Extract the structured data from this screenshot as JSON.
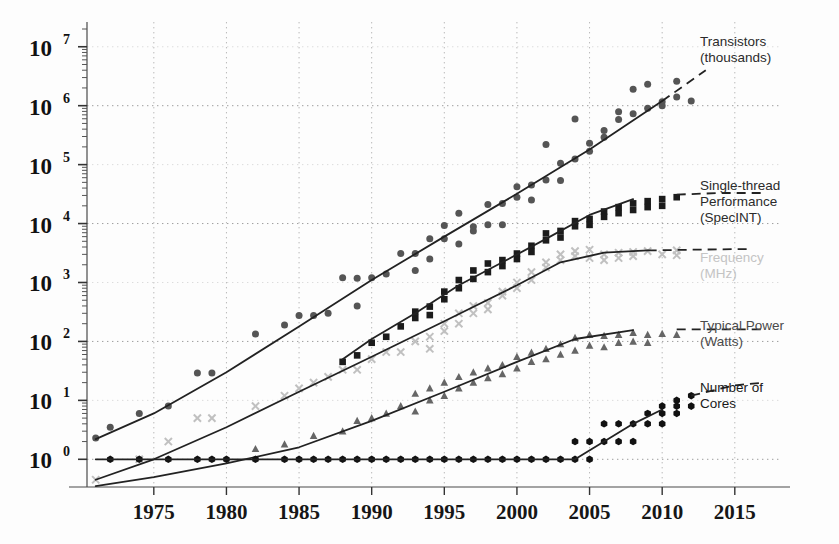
{
  "chart_data": {
    "type": "scatter",
    "title": "",
    "xlabel": "",
    "ylabel": "",
    "xlim": [
      1970,
      2018
    ],
    "ylim_log10": [
      -0.45,
      7.4
    ],
    "yscale": "log",
    "grid": true,
    "legend_position": "right",
    "xticks": [
      1975,
      1980,
      1985,
      1990,
      1995,
      2000,
      2005,
      2010,
      2015
    ],
    "yticks": [
      "10^0",
      "10^1",
      "10^2",
      "10^3",
      "10^4",
      "10^5",
      "10^6",
      "10^7"
    ],
    "ytick_mantissa": "10",
    "ytick_exponents": [
      "7",
      "6",
      "5",
      "4",
      "3",
      "2",
      "1",
      "0"
    ],
    "series": [
      {
        "name": "Transistors (thousands)",
        "legend_line1": "Transistors",
        "legend_line2": "(thousands)",
        "marker": "circle",
        "color": "#555555",
        "legend_y": 46,
        "trend": [
          [
            1971,
            2.2
          ],
          [
            1975,
            6.0
          ],
          [
            1980,
            30
          ],
          [
            1985,
            180
          ],
          [
            1990,
            1100
          ],
          [
            1995,
            6000
          ],
          [
            2000,
            32000
          ],
          [
            2005,
            180000
          ],
          [
            2010,
            1200000
          ],
          [
            2013,
            4000000
          ]
        ],
        "trend_dash_from": 2010,
        "points": [
          [
            1971,
            2.3
          ],
          [
            1972,
            3.5
          ],
          [
            1974,
            6.0
          ],
          [
            1976,
            8.0
          ],
          [
            1978,
            29
          ],
          [
            1979,
            29
          ],
          [
            1982,
            134
          ],
          [
            1984,
            190
          ],
          [
            1985,
            275
          ],
          [
            1986,
            275
          ],
          [
            1987,
            300
          ],
          [
            1988,
            1200
          ],
          [
            1989,
            1180
          ],
          [
            1989,
            400
          ],
          [
            1990,
            1200
          ],
          [
            1991,
            1400
          ],
          [
            1992,
            3100
          ],
          [
            1993,
            3100
          ],
          [
            1993,
            1600
          ],
          [
            1994,
            2500
          ],
          [
            1994,
            5500
          ],
          [
            1995,
            5500
          ],
          [
            1995,
            9300
          ],
          [
            1996,
            4500
          ],
          [
            1996,
            15000
          ],
          [
            1997,
            7500
          ],
          [
            1997,
            8800
          ],
          [
            1998,
            9500
          ],
          [
            1998,
            21000
          ],
          [
            1999,
            22000
          ],
          [
            1999,
            9500
          ],
          [
            2000,
            42000
          ],
          [
            2000,
            28000
          ],
          [
            2001,
            45000
          ],
          [
            2001,
            25000
          ],
          [
            2002,
            55000
          ],
          [
            2002,
            220000
          ],
          [
            2003,
            105000
          ],
          [
            2003,
            54000
          ],
          [
            2004,
            125000
          ],
          [
            2004,
            592000
          ],
          [
            2005,
            230000
          ],
          [
            2005,
            169000
          ],
          [
            2006,
            291000
          ],
          [
            2006,
            380000
          ],
          [
            2007,
            582000
          ],
          [
            2007,
            789000
          ],
          [
            2008,
            731000
          ],
          [
            2008,
            1900000
          ],
          [
            2009,
            904000
          ],
          [
            2009,
            2300000
          ],
          [
            2010,
            1170000
          ],
          [
            2010,
            1000000
          ],
          [
            2011,
            1400000
          ],
          [
            2011,
            2600000
          ],
          [
            2012,
            1200000
          ]
        ]
      },
      {
        "name": "Single-thread Performance (SpecINT)",
        "legend_line1": "Single-thread",
        "legend_line2": "Performance",
        "legend_line3": "(SpecINT)",
        "marker": "square",
        "color": "#1b1b1b",
        "legend_y": 190,
        "trend": [
          [
            1988,
            50
          ],
          [
            1990,
            110
          ],
          [
            1993,
            300
          ],
          [
            1996,
            900
          ],
          [
            1999,
            2200
          ],
          [
            2002,
            5500
          ],
          [
            2005,
            14000
          ],
          [
            2008,
            26000
          ],
          [
            2011,
            31000
          ],
          [
            2014,
            33000
          ],
          [
            2017,
            33000
          ]
        ],
        "trend_dash_from": 2010,
        "points": [
          [
            1988,
            45
          ],
          [
            1989,
            58
          ],
          [
            1990,
            95
          ],
          [
            1991,
            120
          ],
          [
            1992,
            180
          ],
          [
            1993,
            250
          ],
          [
            1993,
            320
          ],
          [
            1994,
            390
          ],
          [
            1994,
            280
          ],
          [
            1995,
            520
          ],
          [
            1995,
            700
          ],
          [
            1996,
            800
          ],
          [
            1996,
            1100
          ],
          [
            1997,
            1150
          ],
          [
            1997,
            1600
          ],
          [
            1998,
            1500
          ],
          [
            1998,
            2100
          ],
          [
            1999,
            2400
          ],
          [
            1999,
            1900
          ],
          [
            2000,
            3100
          ],
          [
            2000,
            2500
          ],
          [
            2001,
            4200
          ],
          [
            2001,
            3300
          ],
          [
            2002,
            5200
          ],
          [
            2002,
            6800
          ],
          [
            2003,
            7500
          ],
          [
            2003,
            5800
          ],
          [
            2004,
            9000
          ],
          [
            2004,
            11000
          ],
          [
            2005,
            12000
          ],
          [
            2005,
            9500
          ],
          [
            2006,
            16000
          ],
          [
            2006,
            13000
          ],
          [
            2007,
            19000
          ],
          [
            2007,
            15000
          ],
          [
            2008,
            22000
          ],
          [
            2008,
            17000
          ],
          [
            2009,
            24000
          ],
          [
            2009,
            19000
          ],
          [
            2010,
            26000
          ],
          [
            2010,
            20000
          ],
          [
            2011,
            28000
          ]
        ]
      },
      {
        "name": "Frequency (MHz)",
        "legend_line1": "Frequency",
        "legend_line2": "(MHz)",
        "marker": "cross",
        "color": "#c0c0c0",
        "legend_y": 262,
        "trend": [
          [
            1971,
            0.45
          ],
          [
            1975,
            1.0
          ],
          [
            1980,
            3.5
          ],
          [
            1985,
            14
          ],
          [
            1990,
            55
          ],
          [
            1995,
            220
          ],
          [
            2000,
            900
          ],
          [
            2003,
            2200
          ],
          [
            2006,
            3200
          ],
          [
            2009,
            3500
          ],
          [
            2012,
            3600
          ],
          [
            2016,
            3700
          ]
        ],
        "trend_dash_from": 2009,
        "points": [
          [
            1971,
            0.45
          ],
          [
            1974,
            1.0
          ],
          [
            1976,
            2.0
          ],
          [
            1978,
            5.0
          ],
          [
            1979,
            5.0
          ],
          [
            1982,
            8.0
          ],
          [
            1984,
            12
          ],
          [
            1985,
            16
          ],
          [
            1986,
            20
          ],
          [
            1987,
            25
          ],
          [
            1988,
            33
          ],
          [
            1989,
            33
          ],
          [
            1990,
            50
          ],
          [
            1991,
            66
          ],
          [
            1992,
            66
          ],
          [
            1993,
            100
          ],
          [
            1994,
            120
          ],
          [
            1994,
            75
          ],
          [
            1995,
            150
          ],
          [
            1995,
            200
          ],
          [
            1996,
            200
          ],
          [
            1996,
            300
          ],
          [
            1997,
            300
          ],
          [
            1997,
            400
          ],
          [
            1998,
            450
          ],
          [
            1998,
            350
          ],
          [
            1999,
            600
          ],
          [
            1999,
            700
          ],
          [
            2000,
            1000
          ],
          [
            2000,
            800
          ],
          [
            2001,
            1500
          ],
          [
            2001,
            1100
          ],
          [
            2002,
            2200
          ],
          [
            2002,
            1800
          ],
          [
            2003,
            3000
          ],
          [
            2003,
            2400
          ],
          [
            2004,
            3400
          ],
          [
            2004,
            2800
          ],
          [
            2005,
            3600
          ],
          [
            2005,
            2600
          ],
          [
            2006,
            3000
          ],
          [
            2006,
            2400
          ],
          [
            2007,
            3200
          ],
          [
            2007,
            2600
          ],
          [
            2008,
            3300
          ],
          [
            2008,
            2800
          ],
          [
            2009,
            3400
          ],
          [
            2010,
            3000
          ],
          [
            2011,
            3500
          ],
          [
            2011,
            2900
          ]
        ]
      },
      {
        "name": "Typical Power (Watts)",
        "legend_line1": "Typical Power",
        "legend_line2": "(Watts)",
        "marker": "triangle",
        "color": "#666666",
        "legend_y": 330,
        "trend": [
          [
            1971,
            0.35
          ],
          [
            1975,
            0.5
          ],
          [
            1980,
            0.85
          ],
          [
            1985,
            1.6
          ],
          [
            1990,
            4.5
          ],
          [
            1995,
            14
          ],
          [
            2000,
            45
          ],
          [
            2004,
            110
          ],
          [
            2008,
            155
          ],
          [
            2011,
            160
          ],
          [
            2014,
            160
          ],
          [
            2017,
            160
          ]
        ],
        "trend_dash_from": 2009,
        "points": [
          [
            1982,
            1.5
          ],
          [
            1984,
            1.8
          ],
          [
            1986,
            2.5
          ],
          [
            1988,
            3.0
          ],
          [
            1989,
            4.5
          ],
          [
            1990,
            5.0
          ],
          [
            1991,
            6.0
          ],
          [
            1992,
            8.0
          ],
          [
            1993,
            13
          ],
          [
            1993,
            6.5
          ],
          [
            1994,
            10
          ],
          [
            1994,
            16
          ],
          [
            1995,
            20
          ],
          [
            1995,
            12
          ],
          [
            1996,
            25
          ],
          [
            1996,
            16
          ],
          [
            1997,
            30
          ],
          [
            1997,
            20
          ],
          [
            1998,
            35
          ],
          [
            1998,
            24
          ],
          [
            1999,
            40
          ],
          [
            1999,
            28
          ],
          [
            2000,
            55
          ],
          [
            2000,
            35
          ],
          [
            2001,
            65
          ],
          [
            2001,
            45
          ],
          [
            2002,
            75
          ],
          [
            2002,
            50
          ],
          [
            2003,
            90
          ],
          [
            2003,
            60
          ],
          [
            2004,
            115
          ],
          [
            2004,
            70
          ],
          [
            2005,
            130
          ],
          [
            2005,
            85
          ],
          [
            2006,
            125
          ],
          [
            2006,
            80
          ],
          [
            2007,
            130
          ],
          [
            2007,
            95
          ],
          [
            2008,
            140
          ],
          [
            2008,
            100
          ],
          [
            2009,
            130
          ],
          [
            2009,
            95
          ],
          [
            2010,
            135
          ],
          [
            2011,
            130
          ]
        ]
      },
      {
        "name": "Number of Cores",
        "legend_line1": "Number of",
        "legend_line2": "Cores",
        "marker": "hexagon",
        "color": "#111111",
        "legend_y": 392,
        "trend": [
          [
            1971,
            1
          ],
          [
            1980,
            1
          ],
          [
            1990,
            1
          ],
          [
            2000,
            1
          ],
          [
            2004,
            1
          ],
          [
            2006,
            2
          ],
          [
            2008,
            4
          ],
          [
            2010,
            7
          ],
          [
            2012,
            12
          ],
          [
            2015,
            18
          ],
          [
            2017,
            20
          ]
        ],
        "trend_dash_from": 2011,
        "points": [
          [
            1972,
            1
          ],
          [
            1974,
            1
          ],
          [
            1976,
            1
          ],
          [
            1978,
            1
          ],
          [
            1979,
            1
          ],
          [
            1980,
            1
          ],
          [
            1982,
            1
          ],
          [
            1984,
            1
          ],
          [
            1985,
            1
          ],
          [
            1986,
            1
          ],
          [
            1987,
            1
          ],
          [
            1988,
            1
          ],
          [
            1989,
            1
          ],
          [
            1990,
            1
          ],
          [
            1991,
            1
          ],
          [
            1992,
            1
          ],
          [
            1993,
            1
          ],
          [
            1994,
            1
          ],
          [
            1995,
            1
          ],
          [
            1996,
            1
          ],
          [
            1997,
            1
          ],
          [
            1998,
            1
          ],
          [
            1999,
            1
          ],
          [
            2000,
            1
          ],
          [
            2001,
            1
          ],
          [
            2002,
            1
          ],
          [
            2003,
            1
          ],
          [
            2004,
            1
          ],
          [
            2004,
            2
          ],
          [
            2005,
            2
          ],
          [
            2005,
            1
          ],
          [
            2006,
            2
          ],
          [
            2006,
            4
          ],
          [
            2007,
            2
          ],
          [
            2007,
            4
          ],
          [
            2008,
            4
          ],
          [
            2008,
            2
          ],
          [
            2009,
            4
          ],
          [
            2009,
            6
          ],
          [
            2010,
            6
          ],
          [
            2010,
            8
          ],
          [
            2010,
            4
          ],
          [
            2011,
            8
          ],
          [
            2011,
            6
          ],
          [
            2011,
            10
          ],
          [
            2012,
            8
          ],
          [
            2012,
            12
          ]
        ]
      }
    ]
  }
}
